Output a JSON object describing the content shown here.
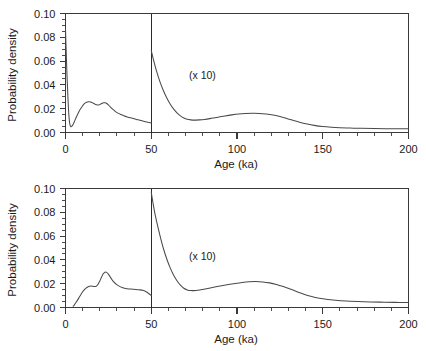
{
  "figure": {
    "title": "",
    "panel_count": 2
  },
  "chart_data": [
    {
      "type": "line",
      "panel": "top",
      "title": "",
      "xlabel": "Age (ka)",
      "ylabel": "Probability density",
      "xlim": [
        0,
        200
      ],
      "ylim": [
        0.0,
        0.1
      ],
      "grid": false,
      "legend": null,
      "annotations": [
        {
          "text": "(x 10)",
          "x": 72,
          "y": 0.045
        }
      ],
      "x_major_ticks": [
        0,
        50,
        100,
        150,
        200
      ],
      "x_major_tick_labels": [
        "0",
        "50",
        "100",
        "150",
        "200"
      ],
      "x_minor_tick_step": 10,
      "y_major_ticks": [
        0.0,
        0.02,
        0.04,
        0.06,
        0.08,
        0.1
      ],
      "y_major_tick_labels": [
        "0.00",
        "0.02",
        "0.04",
        "0.06",
        "0.08",
        "0.10"
      ],
      "y_minor_tick_step": 0.005,
      "divider_x": 50,
      "divider_note": "vertical break at 50 ka; right segment scaled (x 10)",
      "series": [
        {
          "name": "segment-0-50",
          "x": [
            0.0,
            0.4,
            0.9,
            1.4,
            1.9,
            2.4,
            3.0,
            3.6,
            4.4,
            5.2,
            6.2,
            7.3,
            8.5,
            9.8,
            11.0,
            12.3,
            13.5,
            14.6,
            15.6,
            16.6,
            17.6,
            18.6,
            19.5,
            20.4,
            21.3,
            22.2,
            23.1,
            24.0,
            25.0,
            26.2,
            27.5,
            29.0,
            30.6,
            32.3,
            34.0,
            36.0,
            38.0,
            40.0,
            42.0,
            44.0,
            46.0,
            48.0,
            50.0
          ],
          "y": [
            0.087,
            0.068,
            0.047,
            0.03,
            0.016,
            0.008,
            0.005,
            0.0052,
            0.0068,
            0.0093,
            0.0126,
            0.016,
            0.0193,
            0.0221,
            0.0242,
            0.0254,
            0.0258,
            0.0257,
            0.0251,
            0.0243,
            0.0235,
            0.0231,
            0.0232,
            0.0238,
            0.0245,
            0.025,
            0.025,
            0.0244,
            0.0232,
            0.0214,
            0.0196,
            0.0178,
            0.0163,
            0.0151,
            0.0141,
            0.0131,
            0.0123,
            0.0116,
            0.0108,
            0.01,
            0.0093,
            0.0086,
            0.008
          ]
        },
        {
          "name": "segment-50-200",
          "x": [
            50.0,
            51.5,
            53.0,
            55.0,
            57.0,
            59.0,
            61.0,
            63.0,
            65.0,
            67.0,
            69.0,
            71.0,
            73.0,
            75.0,
            78.0,
            81.0,
            85.0,
            89.0,
            93.0,
            97.0,
            101.0,
            105.0,
            109.0,
            113.0,
            117.0,
            121.0,
            125.0,
            129.0,
            133.0,
            137.0,
            141.0,
            145.0,
            150.0,
            155.0,
            160.0,
            166.0,
            172.0,
            180.0,
            190.0,
            200.0
          ],
          "y": [
            0.069,
            0.06,
            0.052,
            0.043,
            0.0355,
            0.0292,
            0.024,
            0.0198,
            0.0165,
            0.014,
            0.0122,
            0.0111,
            0.0106,
            0.0104,
            0.0106,
            0.011,
            0.0119,
            0.0129,
            0.0139,
            0.0148,
            0.0155,
            0.0159,
            0.0161,
            0.016,
            0.0155,
            0.0147,
            0.0134,
            0.0118,
            0.0101,
            0.0085,
            0.0071,
            0.006,
            0.005,
            0.0044,
            0.004,
            0.0037,
            0.0035,
            0.0033,
            0.0032,
            0.0031
          ]
        }
      ]
    },
    {
      "type": "line",
      "panel": "bottom",
      "title": "",
      "xlabel": "Age (ka)",
      "ylabel": "Probability density",
      "xlim": [
        0,
        200
      ],
      "ylim": [
        0.0,
        0.1
      ],
      "grid": false,
      "legend": null,
      "annotations": [
        {
          "text": "(x 10)",
          "x": 72,
          "y": 0.04
        }
      ],
      "x_major_ticks": [
        0,
        50,
        100,
        150,
        200
      ],
      "x_major_tick_labels": [
        "0",
        "50",
        "100",
        "150",
        "200"
      ],
      "x_minor_tick_step": 10,
      "y_major_ticks": [
        0.0,
        0.02,
        0.04,
        0.06,
        0.08,
        0.1
      ],
      "y_major_tick_labels": [
        "0.00",
        "0.02",
        "0.04",
        "0.06",
        "0.08",
        "0.10"
      ],
      "y_minor_tick_step": 0.005,
      "divider_x": 50,
      "divider_note": "vertical break at 50 ka; right segment scaled (x 10)",
      "series": [
        {
          "name": "segment-0-50",
          "x": [
            4.5,
            5.2,
            6.0,
            7.0,
            8.0,
            9.0,
            10.0,
            11.0,
            12.0,
            13.0,
            14.0,
            15.0,
            16.0,
            17.0,
            18.0,
            19.0,
            20.0,
            21.0,
            22.0,
            23.0,
            24.0,
            25.0,
            26.0,
            27.0,
            28.0,
            29.5,
            31.0,
            33.0,
            35.0,
            37.0,
            39.0,
            41.0,
            43.0,
            45.0,
            47.0,
            48.5,
            50.0
          ],
          "y": [
            0.001,
            0.0022,
            0.004,
            0.0062,
            0.0086,
            0.011,
            0.0132,
            0.015,
            0.0163,
            0.0172,
            0.0178,
            0.018,
            0.0178,
            0.0176,
            0.018,
            0.0196,
            0.0222,
            0.0255,
            0.0283,
            0.0297,
            0.0295,
            0.028,
            0.0258,
            0.0236,
            0.0217,
            0.0196,
            0.0182,
            0.0168,
            0.016,
            0.0156,
            0.0154,
            0.0152,
            0.0149,
            0.0144,
            0.0132,
            0.0118,
            0.01
          ]
        },
        {
          "name": "segment-50-200",
          "x": [
            50.0,
            51.0,
            52.0,
            53.5,
            55.0,
            57.0,
            59.0,
            61.0,
            63.0,
            65.0,
            67.0,
            69.0,
            71.0,
            73.0,
            76.0,
            79.0,
            83.0,
            87.0,
            91.0,
            95.0,
            99.0,
            103.0,
            107.0,
            111.0,
            115.0,
            119.0,
            123.0,
            127.0,
            131.0,
            135.0,
            139.0,
            143.0,
            148.0,
            153.0,
            159.0,
            166.0,
            174.0,
            183.0,
            192.0,
            200.0
          ],
          "y": [
            0.097,
            0.088,
            0.08,
            0.07,
            0.061,
            0.05,
            0.041,
            0.0335,
            0.0273,
            0.0225,
            0.0188,
            0.0162,
            0.0148,
            0.0142,
            0.0143,
            0.0149,
            0.016,
            0.0172,
            0.0183,
            0.0193,
            0.0202,
            0.021,
            0.0216,
            0.0218,
            0.0215,
            0.0207,
            0.0194,
            0.0176,
            0.0155,
            0.0133,
            0.0112,
            0.0094,
            0.0077,
            0.0067,
            0.0059,
            0.0053,
            0.0048,
            0.0045,
            0.0043,
            0.0042
          ]
        }
      ]
    }
  ]
}
